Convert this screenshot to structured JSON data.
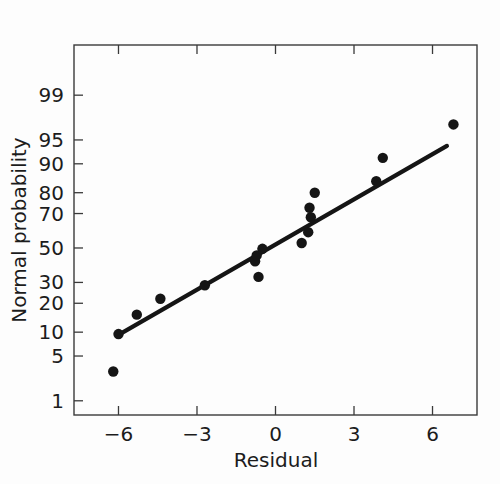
{
  "chart_data": {
    "type": "scatter",
    "title": "",
    "subtitle": "",
    "xlabel": "Residual",
    "ylabel": "Normal probability",
    "x_ticks": [
      -6,
      -3,
      0,
      3,
      6
    ],
    "x_tick_labels": [
      "−6",
      "−3",
      "0",
      "3",
      "6"
    ],
    "y_ticks": [
      1,
      5,
      10,
      20,
      30,
      50,
      70,
      80,
      90,
      95,
      99
    ],
    "y_tick_labels": [
      "1",
      "5",
      "10",
      "20",
      "30",
      "50",
      "70",
      "80",
      "90",
      "95",
      "99"
    ],
    "xlim": [
      -7.7,
      7.7
    ],
    "ylim": [
      0.55,
      99.9
    ],
    "y_scale": "normal-probability",
    "grid": false,
    "legend": false,
    "legend_position": "none",
    "point_color": "#151515",
    "line_color": "#151515",
    "axis_color": "#3a3a3a",
    "background_color": "#fdfdfd",
    "points": [
      {
        "x": -6.2,
        "y": 3.0
      },
      {
        "x": -6.0,
        "y": 9.5
      },
      {
        "x": -5.3,
        "y": 15.5
      },
      {
        "x": -4.4,
        "y": 22.0
      },
      {
        "x": -2.7,
        "y": 28.5
      },
      {
        "x": -0.78,
        "y": 42.0
      },
      {
        "x": -0.72,
        "y": 45.5
      },
      {
        "x": -0.5,
        "y": 49.5
      },
      {
        "x": -0.65,
        "y": 33.0
      },
      {
        "x": 1.0,
        "y": 53.0
      },
      {
        "x": 1.25,
        "y": 59.5
      },
      {
        "x": 1.35,
        "y": 68.0
      },
      {
        "x": 1.3,
        "y": 73.0
      },
      {
        "x": 1.5,
        "y": 80.0
      },
      {
        "x": 3.85,
        "y": 84.5
      },
      {
        "x": 4.1,
        "y": 91.5
      },
      {
        "x": 6.8,
        "y": 97.0
      }
    ],
    "fit_line": {
      "x_start": -6.0,
      "y_start": 9.3,
      "x_end": 6.55,
      "y_end": 94.0
    }
  },
  "figure": {
    "point_radius": 5.2,
    "line_width": 4.2
  }
}
